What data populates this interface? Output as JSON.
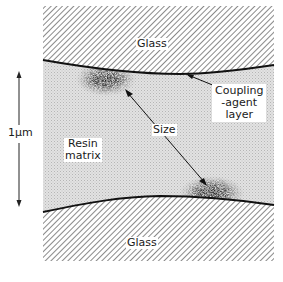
{
  "figure": {
    "type": "schematic cross-section",
    "regions": {
      "top_glass": {
        "label": "Glass"
      },
      "bottom_glass": {
        "label": "Glass"
      },
      "resin": {
        "label_line1": "Resin",
        "label_line2": "matrix"
      }
    },
    "annotations": {
      "coupling": {
        "line1": "Coupling",
        "line2": "-agent",
        "line3": "layer"
      },
      "size": {
        "label": "Size"
      }
    },
    "scale_bar": {
      "label": "1μm"
    },
    "colors": {
      "hatch": "#555555",
      "resin_fill": "#d8d8d8",
      "interface_line": "#111111",
      "size_particles": "#1a1a1a"
    }
  }
}
